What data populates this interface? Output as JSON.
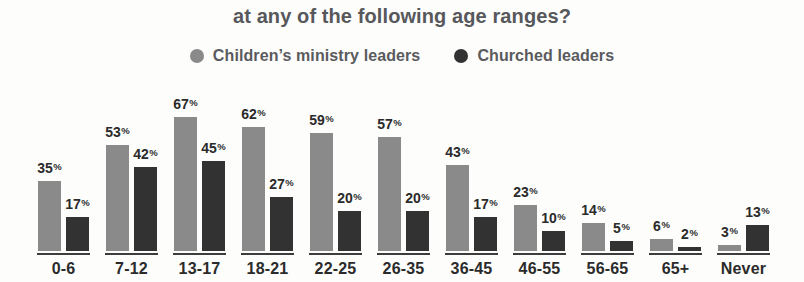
{
  "title": "at any of the following age ranges?",
  "chart_data": {
    "type": "bar",
    "title": "at any of the following age ranges?",
    "categories": [
      "0-6",
      "7-12",
      "13-17",
      "18-21",
      "22-25",
      "26-35",
      "36-45",
      "46-55",
      "56-65",
      "65+",
      "Never"
    ],
    "series": [
      {
        "name": "Children’s ministry leaders",
        "color": "#8a8a8a",
        "values": [
          35,
          53,
          67,
          62,
          59,
          57,
          43,
          23,
          14,
          6,
          3
        ]
      },
      {
        "name": "Churched leaders",
        "color": "#323232",
        "values": [
          17,
          42,
          45,
          27,
          20,
          20,
          17,
          10,
          5,
          2,
          13
        ]
      }
    ],
    "unit": "%",
    "xlabel": "",
    "ylabel": "",
    "ylim": [
      0,
      70
    ],
    "grid": false,
    "legend_position": "top",
    "value_labels": "above-bars"
  },
  "colors": {
    "background": "#fdfdfc",
    "title_text": "#57585b",
    "legend_text": "#5a5b5e",
    "label_text": "#2b2b2b",
    "baseline_rule": "#3d3d3d",
    "series_gray": "#8a8a8a",
    "series_dark": "#323232"
  }
}
